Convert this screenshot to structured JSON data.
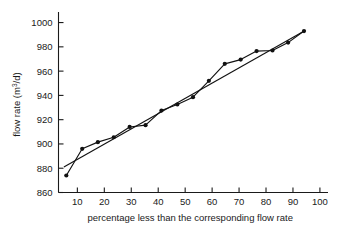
{
  "chart_data": {
    "type": "scatter",
    "title": "",
    "xlabel": "percentage less than the corresponding flow rate",
    "ylabel": "flow rate (m3/d)",
    "ylabel_base": "flow rate (m",
    "ylabel_sup": "3",
    "ylabel_tail": "/d)",
    "xlim": [
      3,
      103
    ],
    "ylim": [
      860,
      1005
    ],
    "xticks": [
      10,
      20,
      30,
      40,
      50,
      60,
      70,
      80,
      90,
      100
    ],
    "yticks": [
      860,
      880,
      900,
      920,
      940,
      960,
      980,
      1000
    ],
    "grid": false,
    "legend": false,
    "marker": "filled-circle",
    "series": [
      {
        "name": "flow rate data",
        "connected": true,
        "x": [
          5.9,
          11.8,
          17.6,
          23.5,
          29.4,
          35.3,
          41.2,
          47.1,
          52.9,
          58.8,
          64.7,
          70.6,
          76.5,
          82.4,
          88.2,
          94.1
        ],
        "y": [
          874,
          896,
          901.5,
          905.5,
          914,
          915.5,
          927.5,
          932.5,
          938.5,
          952,
          966,
          969.5,
          976.5,
          977,
          983.5,
          993
        ]
      },
      {
        "name": "straight reference line",
        "connected": true,
        "markers": false,
        "x": [
          5.0,
          94.5
        ],
        "y": [
          881,
          993.5
        ]
      }
    ]
  },
  "axis": {
    "x_tick_labels": [
      "10",
      "20",
      "30",
      "40",
      "50",
      "60",
      "70",
      "80",
      "90",
      "100"
    ],
    "y_tick_labels": [
      "860",
      "880",
      "900",
      "920",
      "940",
      "960",
      "980",
      "1000"
    ]
  }
}
